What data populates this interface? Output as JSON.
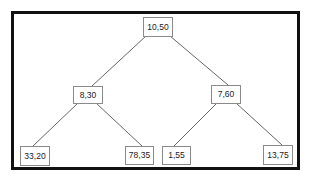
{
  "diagram": {
    "type": "binary-tree",
    "colors": {
      "frame_border": "#111111",
      "node_border": "#8a8a8a",
      "edge": "#555555",
      "text": "#222222",
      "background": "#ffffff"
    },
    "nodes": [
      {
        "id": "root",
        "label": "10,50",
        "level": 0
      },
      {
        "id": "left",
        "label": "8,30",
        "level": 1,
        "parent": "root"
      },
      {
        "id": "right",
        "label": "7,60",
        "level": 1,
        "parent": "root"
      },
      {
        "id": "left-left",
        "label": "33,20",
        "level": 2,
        "parent": "left"
      },
      {
        "id": "left-right",
        "label": "78,35",
        "level": 2,
        "parent": "left"
      },
      {
        "id": "right-left",
        "label": "1,55",
        "level": 2,
        "parent": "right"
      },
      {
        "id": "right-right",
        "label": "13,75",
        "level": 2,
        "parent": "right"
      }
    ],
    "edges": [
      {
        "from": "root",
        "to": "left"
      },
      {
        "from": "root",
        "to": "right"
      },
      {
        "from": "left",
        "to": "left-left"
      },
      {
        "from": "left",
        "to": "left-right"
      },
      {
        "from": "right",
        "to": "right-left"
      },
      {
        "from": "right",
        "to": "right-right"
      }
    ]
  }
}
